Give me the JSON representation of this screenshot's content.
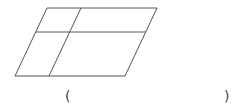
{
  "figure": {
    "shape": "parallelogram",
    "stroke_color": "#555555",
    "outline": [
      [
        47,
        8
      ],
      [
        157,
        8
      ],
      [
        125,
        76
      ],
      [
        15,
        76
      ]
    ],
    "lines": [
      {
        "name": "horizontal-divider",
        "from": [
          36,
          32
        ],
        "to": [
          146,
          32
        ]
      },
      {
        "name": "slanted-divider",
        "from": [
          81,
          8
        ],
        "to": [
          49,
          76
        ]
      }
    ]
  },
  "answer_blank": {
    "open": "(",
    "close": ")",
    "value": ""
  }
}
